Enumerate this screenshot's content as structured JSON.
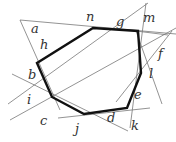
{
  "diagram": {
    "labels": [
      {
        "id": "a",
        "text": "a",
        "x": 31,
        "y": 33
      },
      {
        "id": "h",
        "text": "h",
        "x": 40,
        "y": 49
      },
      {
        "id": "b",
        "text": "b",
        "x": 28,
        "y": 79
      },
      {
        "id": "i",
        "text": "i",
        "x": 27,
        "y": 104
      },
      {
        "id": "c",
        "text": "c",
        "x": 40,
        "y": 125
      },
      {
        "id": "j",
        "text": "j",
        "x": 75,
        "y": 133
      },
      {
        "id": "d",
        "text": "d",
        "x": 107,
        "y": 122
      },
      {
        "id": "k",
        "text": "k",
        "x": 131,
        "y": 130
      },
      {
        "id": "e",
        "text": "e",
        "x": 134,
        "y": 99
      },
      {
        "id": "l",
        "text": "l",
        "x": 149,
        "y": 78
      },
      {
        "id": "f",
        "text": "f",
        "x": 158,
        "y": 58
      },
      {
        "id": "m",
        "text": "m",
        "x": 143,
        "y": 22
      },
      {
        "id": "g",
        "text": "g",
        "x": 116,
        "y": 26
      },
      {
        "id": "n",
        "text": "n",
        "x": 86,
        "y": 21
      }
    ],
    "heptagon": [
      [
        37,
        63
      ],
      [
        52,
        97
      ],
      [
        84,
        114
      ],
      [
        127,
        108
      ],
      [
        141,
        73
      ],
      [
        138,
        31
      ],
      [
        93,
        28
      ]
    ],
    "outer_lines": [
      [
        [
          20,
          20
        ],
        [
          176,
          34
        ]
      ],
      [
        [
          20,
          20
        ],
        [
          60,
          110
        ]
      ],
      [
        [
          10,
          120
        ],
        [
          176,
          28
        ]
      ],
      [
        [
          12,
          74
        ],
        [
          128,
          131
        ]
      ],
      [
        [
          8,
          104
        ],
        [
          148,
          3
        ]
      ],
      [
        [
          58,
          118
        ],
        [
          150,
          108
        ]
      ],
      [
        [
          130,
          128
        ],
        [
          146,
          3
        ]
      ],
      [
        [
          116,
          102
        ],
        [
          172,
          31
        ]
      ],
      [
        [
          136,
          31
        ],
        [
          168,
          35
        ]
      ],
      [
        [
          136,
          31
        ],
        [
          162,
          104
        ]
      ]
    ]
  }
}
